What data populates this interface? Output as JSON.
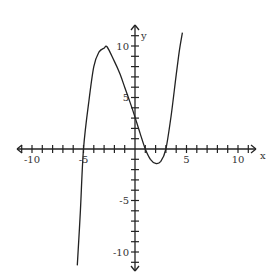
{
  "chart_data": {
    "type": "line",
    "title": "",
    "xlabel": "x",
    "ylabel": "y",
    "xlim": [
      -11.5,
      11.5
    ],
    "ylim": [
      -12,
      12
    ],
    "grid": false,
    "x_tick_labels": [
      "-10",
      "-5",
      "5",
      "10"
    ],
    "y_tick_labels": [
      "10",
      "5",
      "-5",
      "-10"
    ],
    "tick_step": 1,
    "series": [
      {
        "name": "f(x) cubic",
        "description": "cubic with roots near x=-5, x=1, x=3; local max ~(-2.7, 9.7); local min ~(2, -1.4); y-intercept ~3",
        "x": [
          -5.6,
          -5.3,
          -5.0,
          -4.5,
          -4.0,
          -3.5,
          -3.0,
          -2.7,
          -2.0,
          -1.5,
          -1.0,
          -0.5,
          0.0,
          0.5,
          1.0,
          1.5,
          2.0,
          2.5,
          3.0,
          3.5,
          4.0,
          4.3,
          4.6
        ],
        "y": [
          -11.3,
          -6.0,
          0.0,
          4.5,
          8.0,
          9.4,
          9.8,
          9.9,
          8.5,
          7.4,
          6.0,
          4.6,
          3.1,
          1.5,
          0.0,
          -1.0,
          -1.4,
          -1.2,
          0.0,
          3.2,
          7.2,
          9.5,
          11.3
        ]
      }
    ]
  }
}
